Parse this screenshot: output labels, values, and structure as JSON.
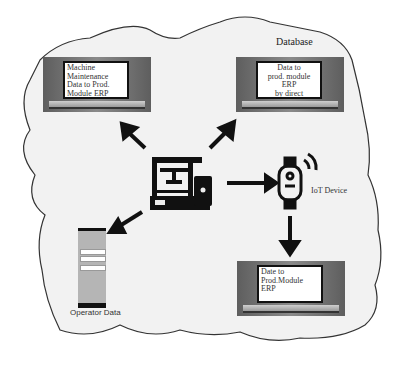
{
  "title": "Database",
  "nodes": {
    "laptop_top_left": {
      "label": "Machine Maintenance Data to Prod. Module ERP"
    },
    "laptop_top_right": {
      "label_lines": [
        "Data to",
        "prod. module ERP",
        "by direct interface"
      ]
    },
    "laptop_bottom_right": {
      "label_lines": [
        "Date to",
        "Prod.Module ERP"
      ]
    },
    "machine": {
      "icon": "3d-printer-machine-icon"
    },
    "iot_device": {
      "label": "IoT Device",
      "icon": "wearable-sensor-icon"
    },
    "operator": {
      "label": "Operator Data",
      "icon": "mobile-form-icon"
    }
  },
  "edges": [
    {
      "from": "machine",
      "to": "laptop_top_left"
    },
    {
      "from": "machine",
      "to": "laptop_top_right"
    },
    {
      "from": "machine",
      "to": "iot_device"
    },
    {
      "from": "machine",
      "to": "operator"
    },
    {
      "from": "iot_device",
      "to": "laptop_bottom_right"
    }
  ],
  "colors": {
    "cloud_fill": "#f2f2f2",
    "outline": "#333333",
    "arrow": "#111111"
  }
}
